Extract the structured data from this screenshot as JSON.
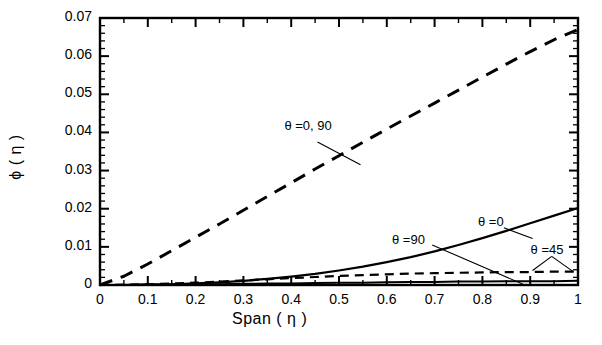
{
  "chart_data": {
    "type": "line",
    "title": "",
    "xlabel": "Span ( η )",
    "ylabel": "ϕ ( η )",
    "xlim": [
      0,
      1
    ],
    "ylim": [
      0,
      0.07
    ],
    "grid": false,
    "legend_position": "inline-annotations",
    "x_ticks": [
      "0",
      "0.1",
      "0.2",
      "0.3",
      "0.4",
      "0.5",
      "0.6",
      "0.7",
      "0.8",
      "0.9",
      "1"
    ],
    "x_tick_values": [
      0,
      0.1,
      0.2,
      0.3,
      0.4,
      0.5,
      0.6,
      0.7,
      0.8,
      0.9,
      1
    ],
    "y_ticks": [
      "0",
      "0.01",
      "0.02",
      "0.03",
      "0.04",
      "0.05",
      "0.06",
      "0.07"
    ],
    "y_tick_values": [
      0,
      0.01,
      0.02,
      0.03,
      0.04,
      0.05,
      0.06,
      0.07
    ],
    "x": [
      0,
      0.05,
      0.1,
      0.15,
      0.2,
      0.25,
      0.3,
      0.35,
      0.4,
      0.45,
      0.5,
      0.55,
      0.6,
      0.65,
      0.7,
      0.75,
      0.8,
      0.85,
      0.9,
      0.95,
      1
    ],
    "series": [
      {
        "name": "θ =0, 90",
        "style": "dashed",
        "color": "#000000",
        "width": 3,
        "label": "θ =0, 90",
        "values": [
          0.0,
          0.0023,
          0.0055,
          0.009,
          0.0125,
          0.016,
          0.0196,
          0.0232,
          0.0268,
          0.0304,
          0.0339,
          0.0374,
          0.0409,
          0.0443,
          0.0477,
          0.0511,
          0.0545,
          0.0579,
          0.0612,
          0.0643,
          0.067
        ]
      },
      {
        "name": "θ =0",
        "style": "solid",
        "color": "#000000",
        "width": 2.2,
        "label": "θ =0",
        "values": [
          0.0,
          0.0,
          0.0001,
          0.0002,
          0.0004,
          0.0007,
          0.0011,
          0.0016,
          0.0022,
          0.0029,
          0.0038,
          0.0048,
          0.006,
          0.0073,
          0.0088,
          0.0105,
          0.0123,
          0.0142,
          0.0162,
          0.0182,
          0.0202
        ]
      },
      {
        "name": "θ =45",
        "style": "dashed",
        "color": "#000000",
        "width": 2.2,
        "label": "θ =45",
        "values": [
          0.0,
          0.0001,
          0.0002,
          0.0004,
          0.0006,
          0.0009,
          0.0012,
          0.0015,
          0.0018,
          0.0021,
          0.0024,
          0.0026,
          0.0028,
          0.003,
          0.0031,
          0.0032,
          0.0033,
          0.0034,
          0.0034,
          0.0035,
          0.0035
        ]
      },
      {
        "name": "θ =90",
        "style": "solid",
        "color": "#000000",
        "width": 2.0,
        "label": "θ =90",
        "values": [
          0.0,
          0.0,
          0.0001,
          0.0001,
          0.0002,
          0.0002,
          0.0003,
          0.0004,
          0.0004,
          0.0005,
          0.0006,
          0.0006,
          0.0007,
          0.0008,
          0.0008,
          0.0009,
          0.0009,
          0.001,
          0.001,
          0.001,
          0.0011
        ]
      }
    ],
    "annotations": [
      {
        "text": "θ =0, 90",
        "x": 0.39,
        "y": 0.0415
      },
      {
        "text": "θ =90",
        "x": 0.615,
        "y": 0.0115
      },
      {
        "text": "θ =0",
        "x": 0.795,
        "y": 0.0163
      },
      {
        "text": "θ =45",
        "x": 0.905,
        "y": 0.0088
      }
    ]
  },
  "labels": {
    "x_title": "Span ( η )",
    "y_title": "ϕ ( η )",
    "xt0": "0",
    "xt1": "0.1",
    "xt2": "0.2",
    "xt3": "0.3",
    "xt4": "0.4",
    "xt5": "0.5",
    "xt6": "0.6",
    "xt7": "0.7",
    "xt8": "0.8",
    "xt9": "0.9",
    "xt10": "1",
    "yt0": "0",
    "yt1": "0.01",
    "yt2": "0.02",
    "yt3": "0.03",
    "yt4": "0.04",
    "yt5": "0.05",
    "yt6": "0.06",
    "yt7": "0.07",
    "ann0": "θ =0, 90",
    "ann1": "θ =90",
    "ann2": "θ =0",
    "ann3": "θ =45"
  }
}
